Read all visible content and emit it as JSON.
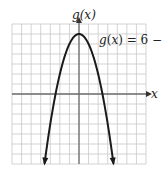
{
  "chart_data": {
    "type": "line",
    "title": "",
    "function": "g(x) = 6 - x^2",
    "xlabel": "x",
    "ylabel": "g(x)",
    "annotation": "g(x) = 6 − x²",
    "xlim": [
      -7,
      7
    ],
    "ylim": [
      -7,
      7
    ],
    "grid": true,
    "grid_step": 1,
    "tick_labels": false,
    "series": [
      {
        "name": "g(x) = 6 - x^2",
        "x": [
          -3.6,
          -3,
          -2.45,
          -2,
          -1,
          0,
          1,
          2,
          2.45,
          3,
          3.6
        ],
        "y": [
          -6.96,
          -3,
          0,
          2,
          5,
          6,
          5,
          2,
          0,
          -3,
          -6.96
        ],
        "arrows_at_ends": true
      }
    ],
    "colors": {
      "grid": "#c8c8c8",
      "axes": "#6e6e6e",
      "curve": "#1a1a1a"
    }
  },
  "labels": {
    "y_axis": "g(x)",
    "x_axis": "x",
    "equation": "g(x) = 6 − x²"
  }
}
